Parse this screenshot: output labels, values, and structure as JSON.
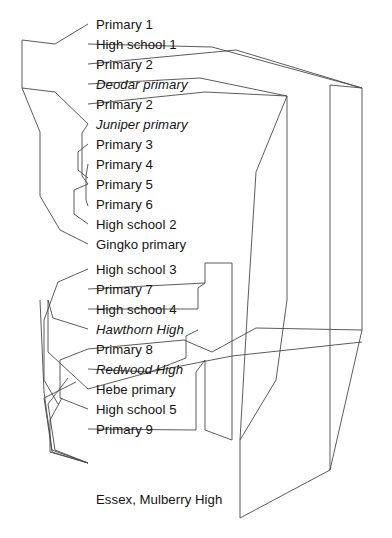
{
  "diagram": {
    "type": "dendrogram",
    "orientation": "horizontal-leaves-right",
    "background_color": "#ffffff",
    "line_color": "#4a4a4a",
    "line_width": 0.9,
    "text_color": "#141414",
    "leaf_x": 88,
    "first_leaf_y": 18,
    "leaf_spacing": 20,
    "leaves": [
      {
        "label": "Primary 1",
        "italic": false,
        "x": 96,
        "y": 18
      },
      {
        "label": "High school 1",
        "italic": false,
        "x": 96,
        "y": 38
      },
      {
        "label": "Primary 2",
        "italic": false,
        "x": 96,
        "y": 58
      },
      {
        "label": "Deodar primary",
        "italic": true,
        "x": 96,
        "y": 78
      },
      {
        "label": "Primary 2",
        "italic": false,
        "x": 96,
        "y": 98
      },
      {
        "label": "Juniper primary",
        "italic": true,
        "x": 96,
        "y": 118
      },
      {
        "label": "Primary 3",
        "italic": false,
        "x": 96,
        "y": 138
      },
      {
        "label": "Primary 4",
        "italic": false,
        "x": 96,
        "y": 158
      },
      {
        "label": "Primary 5",
        "italic": false,
        "x": 96,
        "y": 178
      },
      {
        "label": "Primary 6",
        "italic": false,
        "x": 96,
        "y": 198
      },
      {
        "label": "High school 2",
        "italic": false,
        "x": 96,
        "y": 218
      },
      {
        "label": "Gingko primary",
        "italic": false,
        "x": 96,
        "y": 238
      },
      {
        "label": "High school 3",
        "italic": false,
        "x": 96,
        "y": 263
      },
      {
        "label": "Primary 7",
        "italic": false,
        "x": 96,
        "y": 283
      },
      {
        "label": "High school 4",
        "italic": false,
        "x": 96,
        "y": 303
      },
      {
        "label": "Hawthorn High",
        "italic": true,
        "x": 96,
        "y": 323
      },
      {
        "label": "Primary 8",
        "italic": false,
        "x": 96,
        "y": 343
      },
      {
        "label": "Redwood High",
        "italic": true,
        "x": 96,
        "y": 363
      },
      {
        "label": "Hebe primary",
        "italic": false,
        "x": 96,
        "y": 383
      },
      {
        "label": "High school 5",
        "italic": false,
        "x": 96,
        "y": 403
      },
      {
        "label": "Primary 9",
        "italic": false,
        "x": 96,
        "y": 423
      },
      {
        "label": "Essex, Mulberry High",
        "italic": false,
        "x": 96,
        "y": 493
      },
      {
        "label": "London, High school",
        "italic": false,
        "x": 96,
        "y": 556
      }
    ],
    "polylines": [
      {
        "name": "branch-primary1-upper-arc",
        "points": "88,24 55,44 22,40 22,88 55,92 88,124"
      },
      {
        "name": "branch-high-school-1",
        "points": "88,44 212,47 362,88"
      },
      {
        "name": "branch-primary-2-upper",
        "points": "88,64 236,50 362,88"
      },
      {
        "name": "branch-deodar-primary",
        "points": "88,84 200,78 287,96"
      },
      {
        "name": "branch-primary-2-lower",
        "points": "88,104 205,92 287,96"
      },
      {
        "name": "branch-juniper-primary",
        "points": "88,124 82,133 82,176 88,184"
      },
      {
        "name": "branch-primary-3-4",
        "points": "88,144 78,152 78,170 88,178"
      },
      {
        "name": "branch-primary-5-6",
        "points": "88,164 86,176 86,200 88,206"
      },
      {
        "name": "branch-gingko-cluster",
        "points": "88,244 60,230 40,196 40,132 22,88"
      },
      {
        "name": "branch-high-school-2",
        "points": "88,224 74,214 74,190 88,184"
      },
      {
        "name": "branch-high-school-3",
        "points": "88,269 58,282 44,320 44,380 58,404"
      },
      {
        "name": "branch-primary-7-bracket",
        "points": "88,289 205,283 205,263 232,263"
      },
      {
        "name": "branch-high-school-4",
        "points": "88,309 198,309 198,288 205,283"
      },
      {
        "name": "branch-hawthorn-high",
        "points": "88,329 53,318 48,300 48,352 88,389"
      },
      {
        "name": "branch-primary-8",
        "points": "88,349 184,340 212,352 256,328 362,330"
      },
      {
        "name": "branch-redwood-high",
        "points": "88,369 150,372 186,358 186,336 198,330"
      },
      {
        "name": "branch-hebe-primary",
        "points": "88,389 150,372 232,356 362,342"
      },
      {
        "name": "branch-high-school-5",
        "points": "88,409 60,398 60,360 88,349"
      },
      {
        "name": "branch-primary-9-bracket",
        "points": "88,429 196,430 196,372 205,360"
      },
      {
        "name": "branch-essex-mulberry",
        "points": "88,463 55,450 48,404 68,378"
      },
      {
        "name": "branch-essex-lower-arc",
        "points": "88,463 52,452 44,398 76,382"
      },
      {
        "name": "branch-essex-stem",
        "points": "88,463 50,452 50,420 62,398"
      },
      {
        "name": "branch-essex-long-left",
        "points": "88,463 52,450 44,392 40,300"
      },
      {
        "name": "branch-london-riser",
        "points": "240,518 240,440 248,300 256,172 287,96"
      },
      {
        "name": "branch-london-right-sweep",
        "points": "240,518 330,470 330,85 362,88"
      },
      {
        "name": "branch-outer-right-edge",
        "points": "362,88 362,330 330,470"
      },
      {
        "name": "branch-inner-right-column",
        "points": "287,96 287,300 276,380 240,440"
      },
      {
        "name": "branch-mid-column",
        "points": "232,263 232,356 232,440"
      },
      {
        "name": "branch-mid-lower-bracket",
        "points": "205,360 205,430 232,440"
      }
    ]
  }
}
